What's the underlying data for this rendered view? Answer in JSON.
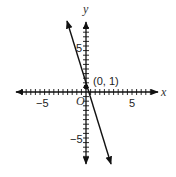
{
  "chart_data": {
    "type": "line",
    "title": "",
    "xlabel": "x",
    "ylabel": "y",
    "origin_label": "O",
    "xlim": [
      -8,
      8
    ],
    "ylim": [
      -8,
      8
    ],
    "x_tick_labels": [
      "-5",
      "5"
    ],
    "y_tick_labels": [
      "5",
      "-5"
    ],
    "grid": false,
    "series": [
      {
        "name": "y = -3x + 1",
        "slope": -3,
        "intercept": 1,
        "x": [
          -2.3,
          2.3
        ],
        "y": [
          7.9,
          -5.9
        ]
      }
    ],
    "points": [
      {
        "x": 0,
        "y": 1,
        "label": "(0, 1)"
      }
    ]
  },
  "labels": {
    "x_axis": "x",
    "y_axis": "y",
    "origin": "O",
    "x_neg5": "−5",
    "x_pos5": "5",
    "y_pos5": "5",
    "y_neg5": "−5",
    "point": "(0, 1)"
  }
}
